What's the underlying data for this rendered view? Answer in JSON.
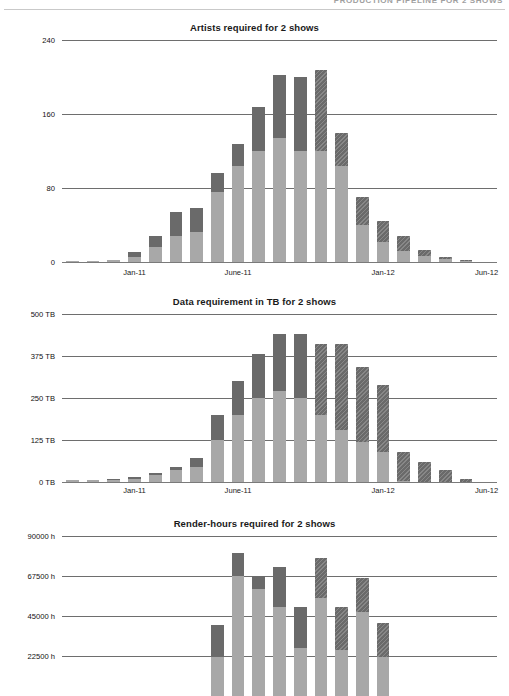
{
  "header": {
    "title": "PRODUCTION PIPELINE FOR 2 SHOWS"
  },
  "charts": [
    {
      "id": "artists",
      "title": "Artists required for 2 shows",
      "ylabels": [
        "0",
        "80",
        "160",
        "240"
      ],
      "xlabels": [
        "Jan-11",
        "June-11",
        "Jan-12",
        "Jun-12"
      ]
    },
    {
      "id": "data",
      "title": "Data requirement in TB for 2 shows",
      "ylabels": [
        "0 TB",
        "125 TB",
        "250 TB",
        "375 TB",
        "500 TB"
      ],
      "xlabels": [
        "Jan-11",
        "June-11",
        "Jan-12",
        "Jun-12"
      ]
    },
    {
      "id": "render",
      "title": "Render-hours required for 2 shows",
      "ylabels": [
        "22500 h",
        "45000 h",
        "67500 h",
        "90000 h"
      ],
      "xlabels": []
    }
  ],
  "palette": {
    "show_a": "#a8a8a8",
    "show_b": "#6a6a6a",
    "gridline": "#6e6e6e",
    "header_rule": "#c9c9c9",
    "text": "#111111"
  },
  "chart_data": [
    {
      "type": "bar",
      "stacked": true,
      "id": "artists",
      "title": "Artists required for 2 shows",
      "xlabel": "",
      "ylabel": "Artists",
      "ylim": [
        0,
        240
      ],
      "yticks": [
        0,
        80,
        160,
        240
      ],
      "ytick_labels": [
        "0",
        "80",
        "160",
        "240"
      ],
      "grid": true,
      "legend": "none",
      "categories": [
        "Oct-10",
        "Nov-10",
        "Dec-10",
        "Jan-11",
        "Feb-11",
        "Mar-11",
        "Apr-11",
        "May-11",
        "June-11",
        "July-11",
        "Aug-11",
        "Sep-11",
        "Oct-11",
        "Nov-11",
        "Dec-11",
        "Jan-12",
        "Feb-12",
        "Mar-12",
        "Apr-12",
        "May-12",
        "Jun-12"
      ],
      "xtick_labels": [
        "Jan-11",
        "June-11",
        "Jan-12",
        "Jun-12"
      ],
      "xtick_indices": [
        3,
        8,
        15,
        20
      ],
      "series": [
        {
          "name": "Show A",
          "color": "#a8a8a8",
          "values": [
            1,
            1,
            2,
            5,
            16,
            28,
            32,
            76,
            104,
            120,
            134,
            120,
            120,
            104,
            40,
            22,
            12,
            7,
            3,
            1,
            0
          ]
        },
        {
          "name": "Show B",
          "color": "#6a6a6a",
          "values": [
            0,
            0,
            0,
            6,
            12,
            26,
            26,
            20,
            24,
            48,
            68,
            80,
            88,
            36,
            30,
            22,
            16,
            6,
            2,
            1,
            0
          ],
          "hatched_from_index": 12
        }
      ],
      "totals": [
        1,
        1,
        2,
        11,
        28,
        54,
        58,
        96,
        128,
        168,
        202,
        200,
        208,
        140,
        70,
        44,
        28,
        13,
        5,
        2,
        0
      ]
    },
    {
      "type": "bar",
      "stacked": true,
      "id": "data",
      "title": "Data requirement in TB for 2 shows",
      "xlabel": "",
      "ylabel": "Data (TB)",
      "ylim": [
        0,
        500
      ],
      "yticks": [
        0,
        125,
        250,
        375,
        500
      ],
      "ytick_labels": [
        "0 TB",
        "125 TB",
        "250 TB",
        "375 TB",
        "500 TB"
      ],
      "grid": true,
      "legend": "none",
      "categories": [
        "Oct-10",
        "Nov-10",
        "Dec-10",
        "Jan-11",
        "Feb-11",
        "Mar-11",
        "Apr-11",
        "May-11",
        "June-11",
        "July-11",
        "Aug-11",
        "Sep-11",
        "Oct-11",
        "Nov-11",
        "Dec-11",
        "Jan-12",
        "Feb-12",
        "Mar-12",
        "Apr-12",
        "May-12",
        "Jun-12"
      ],
      "xtick_labels": [
        "Jan-11",
        "June-11",
        "Jan-12",
        "Jun-12"
      ],
      "xtick_indices": [
        3,
        8,
        15,
        20
      ],
      "series": [
        {
          "name": "Show A",
          "color": "#a8a8a8",
          "values": [
            6,
            6,
            8,
            10,
            22,
            36,
            44,
            125,
            200,
            250,
            272,
            250,
            200,
            155,
            120,
            88,
            4,
            0,
            0,
            0,
            0
          ]
        },
        {
          "name": "Show B",
          "color": "#6a6a6a",
          "values": [
            0,
            0,
            2,
            4,
            6,
            10,
            26,
            75,
            100,
            130,
            168,
            190,
            210,
            255,
            222,
            200,
            86,
            60,
            35,
            8,
            0
          ],
          "hatched_from_index": 12
        }
      ],
      "totals": [
        6,
        6,
        10,
        14,
        28,
        46,
        70,
        200,
        300,
        380,
        440,
        440,
        410,
        410,
        342,
        288,
        90,
        60,
        35,
        8,
        0
      ]
    },
    {
      "type": "bar",
      "stacked": true,
      "id": "render",
      "title": "Render-hours required for 2 shows",
      "xlabel": "",
      "ylabel": "Render hours",
      "ylim": [
        0,
        90000
      ],
      "yticks": [
        22500,
        45000,
        67500,
        90000
      ],
      "ytick_labels": [
        "22500 h",
        "45000 h",
        "67500 h",
        "90000 h"
      ],
      "grid": true,
      "legend": "none",
      "note": "Chart is cropped at the bottom of the screenshot; only the upper portion of the bars is visible.",
      "categories": [
        "Oct-10",
        "Nov-10",
        "Dec-10",
        "Jan-11",
        "Feb-11",
        "Mar-11",
        "Apr-11",
        "May-11",
        "June-11",
        "July-11",
        "Aug-11",
        "Sep-11",
        "Oct-11",
        "Nov-11",
        "Dec-11",
        "Jan-12",
        "Feb-12",
        "Mar-12",
        "Apr-12",
        "May-12",
        "Jun-12"
      ],
      "xtick_labels": [],
      "series": [
        {
          "name": "Show A",
          "color": "#a8a8a8",
          "values": [
            0,
            0,
            0,
            0,
            0,
            0,
            0,
            22000,
            67500,
            60000,
            50000,
            27000,
            55000,
            26000,
            47500,
            22000,
            0,
            0,
            0,
            0,
            0
          ]
        },
        {
          "name": "Show B",
          "color": "#6a6a6a",
          "values": [
            0,
            0,
            0,
            0,
            0,
            0,
            0,
            18000,
            13000,
            7500,
            22500,
            23000,
            22500,
            24000,
            19000,
            19000,
            0,
            0,
            0,
            0,
            0
          ],
          "hatched_from_index": 12
        }
      ],
      "totals": [
        0,
        0,
        0,
        0,
        0,
        0,
        0,
        40000,
        80500,
        67500,
        72500,
        50000,
        77500,
        50000,
        66500,
        41000,
        0,
        0,
        0,
        0,
        0
      ]
    }
  ]
}
